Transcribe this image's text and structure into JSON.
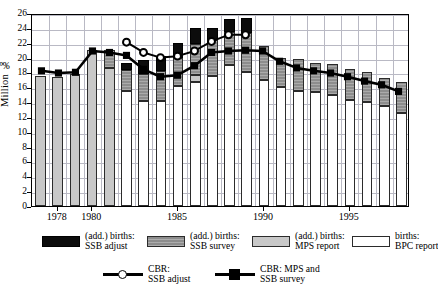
{
  "chart_data": {
    "type": "bar",
    "title": "",
    "subtitle": "",
    "xlabel": "",
    "ylabel": "Million ‰",
    "ylim": [
      0,
      26
    ],
    "ytick_values": [
      0,
      2,
      4,
      6,
      8,
      10,
      12,
      14,
      16,
      18,
      20,
      22,
      24,
      26
    ],
    "xlim_years": [
      1977,
      1998
    ],
    "xtick_labels": [
      "1978",
      "1980",
      "1985",
      "1990",
      "1995"
    ],
    "xtick_years": [
      1978,
      1980,
      1985,
      1990,
      1995
    ],
    "grid": true,
    "stacked": true,
    "legend_position": "below-axes",
    "categories": [
      1977,
      1978,
      1979,
      1980,
      1981,
      1982,
      1983,
      1984,
      1985,
      1986,
      1987,
      1988,
      1989,
      1990,
      1991,
      1992,
      1993,
      1994,
      1995,
      1996,
      1997,
      1998
    ],
    "series": [
      {
        "name": "births: BPC report",
        "key": "bpc_report",
        "color": "#ffffff",
        "values": [
          0,
          0,
          0,
          0,
          0,
          15.5,
          14.2,
          14.2,
          16.2,
          16.7,
          17.5,
          19.0,
          18.0,
          17.0,
          16.0,
          15.5,
          15.3,
          15.0,
          14.3,
          14.0,
          13.5,
          12.5
        ]
      },
      {
        "name": "(add.) births: MPS report",
        "key": "mps_report",
        "color": "#c8c8c8",
        "values": [
          17.5,
          17.4,
          17.8,
          21.0,
          18.6,
          0,
          0,
          0,
          0,
          0.9,
          0,
          0,
          0,
          0,
          0,
          0,
          0,
          0,
          0,
          0,
          0,
          0
        ]
      },
      {
        "name": "(add.) births: SSB survey",
        "key": "ssb_survey",
        "color": "#8d8d8d",
        "values": [
          0,
          0,
          0,
          0,
          2.4,
          2.8,
          3.6,
          4.0,
          3.7,
          4.2,
          4.9,
          4.4,
          5.3,
          4.5,
          4.0,
          4.3,
          4.0,
          4.1,
          4.1,
          4.0,
          3.7,
          4.2
        ]
      },
      {
        "name": "(add.) births: SSB adjust",
        "key": "ssb_adjust",
        "color": "#0c0c0c",
        "values": [
          0,
          0,
          0,
          0,
          0,
          0.9,
          1.9,
          2.0,
          2.0,
          2.2,
          1.6,
          1.8,
          2.0,
          0,
          0,
          0,
          0,
          0,
          0,
          0,
          0,
          0
        ]
      }
    ],
    "lines": [
      {
        "name": "CBR: SSB adjust",
        "key": "cbr_ssb_adjust",
        "marker": "open-circle",
        "color": "#000000",
        "x": [
          1982,
          1983,
          1984,
          1985,
          1986,
          1987,
          1988,
          1989
        ],
        "values": [
          22.3,
          20.9,
          20.2,
          20.4,
          21.1,
          22.4,
          23.3,
          23.3
        ]
      },
      {
        "name": "CBR: MPS and SSB survey",
        "key": "cbr_mps_ssb_survey",
        "marker": "filled-square",
        "color": "#000000",
        "x": [
          1977,
          1978,
          1979,
          1980,
          1981,
          1982,
          1983,
          1984,
          1985,
          1986,
          1987,
          1988,
          1989,
          1990,
          1991,
          1992,
          1993,
          1994,
          1995,
          1996,
          1997,
          1998
        ],
        "values": [
          18.4,
          18.1,
          18.2,
          21.1,
          20.9,
          20.5,
          18.6,
          17.6,
          17.8,
          19.1,
          20.9,
          21.1,
          21.2,
          21.1,
          19.7,
          18.8,
          18.4,
          18.1,
          17.6,
          17.0,
          16.5,
          15.6
        ]
      }
    ]
  },
  "axes": {
    "y_label": "Million ‰",
    "y_ticks": [
      "0",
      "2",
      "4",
      "6",
      "8",
      "10",
      "12",
      "14",
      "16",
      "18",
      "20",
      "22",
      "24",
      "26"
    ],
    "x_ticks": [
      "1978",
      "1980",
      "1985",
      "1990",
      "1995"
    ]
  },
  "legend": {
    "row1": [
      {
        "swatch": "black-swatch",
        "line1": "(add.) births:",
        "line2": "SSB adjust"
      },
      {
        "swatch": "ssb-survey-swatch",
        "line1": "(add.) births:",
        "line2": "SSB survey"
      },
      {
        "swatch": "mps-report-swatch",
        "line1": "(add.) births:",
        "line2": "MPS report"
      },
      {
        "swatch": "bpc-report-swatch",
        "line1": "births:",
        "line2": "BPC report"
      }
    ],
    "row2": [
      {
        "swatch": "open-circle-marker",
        "line1": "CBR:",
        "line2": "SSB adjust"
      },
      {
        "swatch": "filled-square-marker",
        "line1": "CBR: MPS and",
        "line2": "SSB survey"
      }
    ]
  }
}
